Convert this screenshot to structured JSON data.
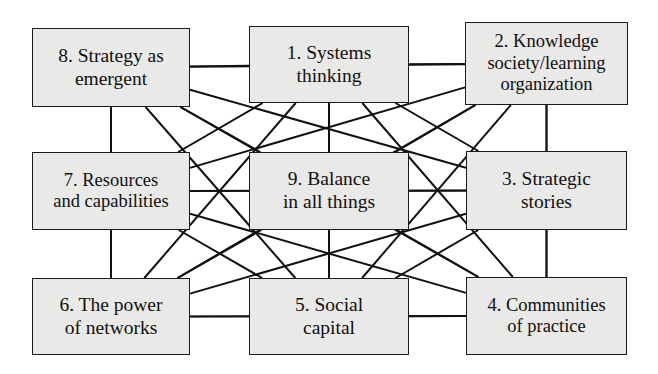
{
  "diagram": {
    "type": "network-grid",
    "background_color": "#ffffff",
    "node_fill_color": "#e9e9e7",
    "node_border_color": "#1a1a1a",
    "edge_color": "#111111",
    "layout": "3x3 grid, fully interconnected",
    "nodes": [
      {
        "id": "n1",
        "number": "1",
        "label": "1. Systems\nthinking",
        "grid": "top-center",
        "x": 249,
        "y": 26,
        "w": 160,
        "h": 77,
        "size_class": "n-size-lg"
      },
      {
        "id": "n2",
        "number": "2",
        "label": "2. Knowledge\nsociety/learning\norganization",
        "grid": "top-right",
        "x": 465,
        "y": 22,
        "w": 163,
        "h": 83,
        "size_class": "n-size-md"
      },
      {
        "id": "n3",
        "number": "3",
        "label": "3. Strategic\nstories",
        "grid": "middle-right",
        "x": 466,
        "y": 151,
        "w": 161,
        "h": 79,
        "size_class": "n-size-lg"
      },
      {
        "id": "n4",
        "number": "4",
        "label": "4. Communities\nof practice",
        "grid": "bottom-right",
        "x": 466,
        "y": 277,
        "w": 161,
        "h": 78,
        "size_class": "n-size-md"
      },
      {
        "id": "n5",
        "number": "5",
        "label": "5. Social\ncapital",
        "grid": "bottom-center",
        "x": 249,
        "y": 278,
        "w": 160,
        "h": 77,
        "size_class": "n-size-lg"
      },
      {
        "id": "n6",
        "number": "6",
        "label": "6. The power\nof networks",
        "grid": "bottom-left",
        "x": 32,
        "y": 278,
        "w": 158,
        "h": 77,
        "size_class": "n-size-lg"
      },
      {
        "id": "n7",
        "number": "7",
        "label": "7. Resources\nand capabilities",
        "grid": "middle-left",
        "x": 32,
        "y": 152,
        "w": 158,
        "h": 78,
        "size_class": "n-size-md"
      },
      {
        "id": "n8",
        "number": "8",
        "label": "8. Strategy as\nemergent",
        "grid": "top-left",
        "x": 32,
        "y": 28,
        "w": 158,
        "h": 79,
        "size_class": "n-size-lg"
      },
      {
        "id": "n9",
        "number": "9",
        "label": "9. Balance\nin all things",
        "grid": "center",
        "x": 249,
        "y": 152,
        "w": 160,
        "h": 78,
        "size_class": "n-size-lg"
      }
    ],
    "edges": [
      {
        "from": "n8",
        "to": "n1",
        "kind": "horizontal"
      },
      {
        "from": "n1",
        "to": "n2",
        "kind": "horizontal"
      },
      {
        "from": "n7",
        "to": "n9",
        "kind": "horizontal"
      },
      {
        "from": "n9",
        "to": "n3",
        "kind": "horizontal"
      },
      {
        "from": "n6",
        "to": "n5",
        "kind": "horizontal"
      },
      {
        "from": "n5",
        "to": "n4",
        "kind": "horizontal"
      },
      {
        "from": "n8",
        "to": "n7",
        "kind": "vertical"
      },
      {
        "from": "n7",
        "to": "n6",
        "kind": "vertical"
      },
      {
        "from": "n1",
        "to": "n9",
        "kind": "vertical"
      },
      {
        "from": "n9",
        "to": "n5",
        "kind": "vertical"
      },
      {
        "from": "n2",
        "to": "n3",
        "kind": "vertical"
      },
      {
        "from": "n3",
        "to": "n4",
        "kind": "vertical"
      },
      {
        "from": "n8",
        "to": "n9",
        "kind": "diagonal"
      },
      {
        "from": "n1",
        "to": "n7",
        "kind": "diagonal"
      },
      {
        "from": "n1",
        "to": "n3",
        "kind": "diagonal"
      },
      {
        "from": "n2",
        "to": "n9",
        "kind": "diagonal"
      },
      {
        "from": "n7",
        "to": "n5",
        "kind": "diagonal"
      },
      {
        "from": "n9",
        "to": "n6",
        "kind": "diagonal"
      },
      {
        "from": "n9",
        "to": "n4",
        "kind": "diagonal"
      },
      {
        "from": "n3",
        "to": "n5",
        "kind": "diagonal"
      },
      {
        "from": "n8",
        "to": "n5",
        "kind": "long-diagonal"
      },
      {
        "from": "n8",
        "to": "n4",
        "kind": "long-diagonal"
      },
      {
        "from": "n8",
        "to": "n3",
        "kind": "long-diagonal"
      },
      {
        "from": "n8",
        "to": "n6",
        "kind": "long-diagonal"
      },
      {
        "from": "n8",
        "to": "n2",
        "kind": "long-diagonal"
      },
      {
        "from": "n1",
        "to": "n6",
        "kind": "long-diagonal"
      },
      {
        "from": "n1",
        "to": "n5",
        "kind": "long-diagonal"
      },
      {
        "from": "n1",
        "to": "n4",
        "kind": "long-diagonal"
      },
      {
        "from": "n2",
        "to": "n7",
        "kind": "long-diagonal"
      },
      {
        "from": "n2",
        "to": "n6",
        "kind": "long-diagonal"
      },
      {
        "from": "n2",
        "to": "n5",
        "kind": "long-diagonal"
      },
      {
        "from": "n2",
        "to": "n4",
        "kind": "long-diagonal"
      },
      {
        "from": "n7",
        "to": "n3",
        "kind": "long-diagonal"
      },
      {
        "from": "n7",
        "to": "n4",
        "kind": "long-diagonal"
      },
      {
        "from": "n6",
        "to": "n3",
        "kind": "long-diagonal"
      },
      {
        "from": "n6",
        "to": "n4",
        "kind": "long-diagonal"
      }
    ]
  }
}
